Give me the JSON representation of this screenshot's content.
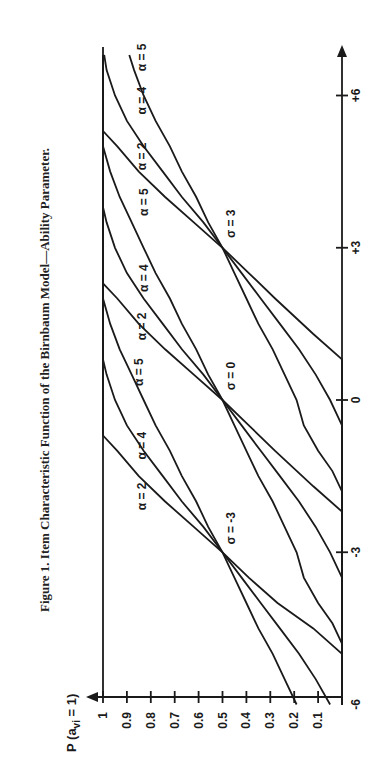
{
  "chart_data": {
    "type": "line",
    "title": "Figure 1. Item Characteristic Function of the Birnbaum Model—Ability Parameter.",
    "xlabel": "",
    "ylabel": "P (a_vi = 1)",
    "ylabel_main": "P (a",
    "ylabel_sub": "vi",
    "ylabel_tail": " = 1)",
    "orientation": "rotated 90° counter-clockwise (ability axis runs upward, probability axis runs horizontally)",
    "x_ticks": [
      {
        "value": -6,
        "label": "-6"
      },
      {
        "value": -3,
        "label": "-3"
      },
      {
        "value": 0,
        "label": "0"
      },
      {
        "value": 3,
        "label": "+3"
      },
      {
        "value": 6,
        "label": "+6"
      }
    ],
    "y_ticks": [
      {
        "value": 1.0,
        "label": "1"
      },
      {
        "value": 0.9,
        "label": "0.9"
      },
      {
        "value": 0.8,
        "label": "0.8"
      },
      {
        "value": 0.7,
        "label": "0.7"
      },
      {
        "value": 0.6,
        "label": "0.6"
      },
      {
        "value": 0.5,
        "label": "0.5"
      },
      {
        "value": 0.4,
        "label": "0.4"
      },
      {
        "value": 0.3,
        "label": "0.3"
      },
      {
        "value": 0.2,
        "label": "0.2"
      },
      {
        "value": 0.1,
        "label": "0.1"
      }
    ],
    "xlim": [
      -6,
      6.8
    ],
    "ylim": [
      0,
      1
    ],
    "grid": false,
    "legend": "none (inline labels)",
    "annotations": [
      {
        "text": "σ = -3",
        "x": -3,
        "y": 0.5
      },
      {
        "text": "σ = 0",
        "x": 0,
        "y": 0.5
      },
      {
        "text": "σ = 3",
        "x": 3,
        "y": 0.5
      }
    ],
    "series": [
      {
        "name": "σ = -3, α = 2",
        "sigma": -3,
        "alpha": 2,
        "points": [
          [
            -6,
            0.0
          ],
          [
            -5.0,
            0.0
          ],
          [
            -4.5,
            0.12
          ],
          [
            -4,
            0.27
          ],
          [
            -3.5,
            0.39
          ],
          [
            -3,
            0.5
          ],
          [
            -2.5,
            0.62
          ],
          [
            -2,
            0.74
          ],
          [
            -1.5,
            0.85
          ],
          [
            -1.0,
            0.94
          ],
          [
            -0.7,
            1.0
          ],
          [
            6.8,
            1.0
          ]
        ]
      },
      {
        "name": "σ = -3, α = 4",
        "sigma": -3,
        "alpha": 4,
        "points": [
          [
            -6,
            0.05
          ],
          [
            -5.5,
            0.11
          ],
          [
            -5,
            0.18
          ],
          [
            -4.5,
            0.26
          ],
          [
            -4,
            0.34
          ],
          [
            -3.5,
            0.42
          ],
          [
            -3,
            0.5
          ],
          [
            -2.5,
            0.58
          ],
          [
            -2,
            0.67
          ],
          [
            -1.5,
            0.75
          ],
          [
            -1,
            0.83
          ],
          [
            -0.5,
            0.9
          ],
          [
            0,
            0.95
          ],
          [
            0.5,
            0.985
          ],
          [
            0.8,
            1.0
          ],
          [
            6.8,
            1.0
          ]
        ]
      },
      {
        "name": "σ = -3, α = 5",
        "sigma": -3,
        "alpha": 5,
        "points": [
          [
            -6,
            0.19
          ],
          [
            -5.5,
            0.24
          ],
          [
            -5,
            0.29
          ],
          [
            -4.5,
            0.35
          ],
          [
            -4,
            0.4
          ],
          [
            -3.5,
            0.45
          ],
          [
            -3,
            0.5
          ],
          [
            -2.5,
            0.56
          ],
          [
            -2,
            0.61
          ],
          [
            -1.5,
            0.67
          ],
          [
            -1,
            0.72
          ],
          [
            -0.5,
            0.78
          ],
          [
            0,
            0.83
          ],
          [
            0.5,
            0.88
          ],
          [
            1,
            0.93
          ],
          [
            1.5,
            0.97
          ],
          [
            2.0,
            1.0
          ],
          [
            6.8,
            1.0
          ]
        ]
      },
      {
        "name": "σ = 0, α = 2",
        "sigma": 0,
        "alpha": 2,
        "points": [
          [
            -6,
            0.0
          ],
          [
            -2.2,
            0.0
          ],
          [
            -1.7,
            0.12
          ],
          [
            -1,
            0.28
          ],
          [
            -0.5,
            0.39
          ],
          [
            0,
            0.5
          ],
          [
            0.5,
            0.62
          ],
          [
            1,
            0.74
          ],
          [
            1.5,
            0.85
          ],
          [
            2,
            0.94
          ],
          [
            2.3,
            1.0
          ],
          [
            6.8,
            1.0
          ]
        ]
      },
      {
        "name": "σ = 0, α = 4",
        "sigma": 0,
        "alpha": 4,
        "points": [
          [
            -6,
            0.0
          ],
          [
            -3.5,
            0.0
          ],
          [
            -3,
            0.05
          ],
          [
            -2.5,
            0.11
          ],
          [
            -2,
            0.18
          ],
          [
            -1.5,
            0.26
          ],
          [
            -1,
            0.34
          ],
          [
            -0.5,
            0.42
          ],
          [
            0,
            0.5
          ],
          [
            0.5,
            0.58
          ],
          [
            1,
            0.67
          ],
          [
            1.5,
            0.75
          ],
          [
            2,
            0.83
          ],
          [
            2.5,
            0.9
          ],
          [
            3,
            0.95
          ],
          [
            3.5,
            0.985
          ],
          [
            3.8,
            1.0
          ],
          [
            6.8,
            1.0
          ]
        ]
      },
      {
        "name": "σ = 0, α = 5",
        "sigma": 0,
        "alpha": 5,
        "points": [
          [
            -6,
            0.0
          ],
          [
            -4.8,
            0.0
          ],
          [
            -4.4,
            0.04
          ],
          [
            -4,
            0.1
          ],
          [
            -3.5,
            0.16
          ],
          [
            -3,
            0.19
          ],
          [
            -2.5,
            0.24
          ],
          [
            -2,
            0.29
          ],
          [
            -1.5,
            0.35
          ],
          [
            -1,
            0.4
          ],
          [
            -0.5,
            0.45
          ],
          [
            0,
            0.5
          ],
          [
            0.5,
            0.56
          ],
          [
            1,
            0.61
          ],
          [
            1.5,
            0.67
          ],
          [
            2,
            0.72
          ],
          [
            2.5,
            0.78
          ],
          [
            3,
            0.83
          ],
          [
            3.5,
            0.88
          ],
          [
            4,
            0.93
          ],
          [
            4.5,
            0.97
          ],
          [
            5.0,
            1.0
          ],
          [
            6.8,
            1.0
          ]
        ]
      },
      {
        "name": "σ = 3, α = 2",
        "sigma": 3,
        "alpha": 2,
        "points": [
          [
            -6,
            0.0
          ],
          [
            0.8,
            0.0
          ],
          [
            1.3,
            0.12
          ],
          [
            2,
            0.28
          ],
          [
            2.5,
            0.39
          ],
          [
            3,
            0.5
          ],
          [
            3.5,
            0.62
          ],
          [
            4,
            0.74
          ],
          [
            4.5,
            0.85
          ],
          [
            5,
            0.94
          ],
          [
            5.3,
            1.0
          ],
          [
            6.8,
            1.0
          ]
        ]
      },
      {
        "name": "σ = 3, α = 4",
        "sigma": 3,
        "alpha": 4,
        "points": [
          [
            -6,
            0.0
          ],
          [
            -0.5,
            0.0
          ],
          [
            0,
            0.05
          ],
          [
            0.5,
            0.11
          ],
          [
            1,
            0.18
          ],
          [
            1.5,
            0.26
          ],
          [
            2,
            0.34
          ],
          [
            2.5,
            0.42
          ],
          [
            3,
            0.5
          ],
          [
            3.5,
            0.58
          ],
          [
            4,
            0.67
          ],
          [
            4.5,
            0.75
          ],
          [
            5,
            0.83
          ],
          [
            5.5,
            0.9
          ],
          [
            6,
            0.95
          ],
          [
            6.5,
            0.985
          ],
          [
            6.8,
            0.995
          ]
        ]
      },
      {
        "name": "σ = 3, α = 5",
        "sigma": 3,
        "alpha": 5,
        "points": [
          [
            -6,
            0.0
          ],
          [
            -1.8,
            0.0
          ],
          [
            -1.4,
            0.04
          ],
          [
            -1,
            0.1
          ],
          [
            -0.5,
            0.16
          ],
          [
            0,
            0.19
          ],
          [
            0.5,
            0.24
          ],
          [
            1,
            0.29
          ],
          [
            1.5,
            0.35
          ],
          [
            2,
            0.4
          ],
          [
            2.5,
            0.45
          ],
          [
            3,
            0.5
          ],
          [
            3.5,
            0.56
          ],
          [
            4,
            0.61
          ],
          [
            4.5,
            0.67
          ],
          [
            5,
            0.72
          ],
          [
            5.5,
            0.78
          ],
          [
            6,
            0.83
          ],
          [
            6.5,
            0.87
          ],
          [
            6.8,
            0.89
          ]
        ]
      }
    ],
    "curve_labels": [
      {
        "text": "α = 2",
        "x": -1.9,
        "y": 0.88
      },
      {
        "text": "α = 4",
        "x": -0.9,
        "y": 0.88
      },
      {
        "text": "α = 5",
        "x": 0.55,
        "y": 0.89
      },
      {
        "text": "α = 2",
        "x": 1.45,
        "y": 0.88
      },
      {
        "text": "α = 4",
        "x": 2.4,
        "y": 0.87
      },
      {
        "text": "α = 5",
        "x": 3.9,
        "y": 0.87
      },
      {
        "text": "α = 2",
        "x": 4.8,
        "y": 0.88
      },
      {
        "text": "α = 4",
        "x": 5.9,
        "y": 0.88
      },
      {
        "text": "α = 5",
        "x": 6.75,
        "y": 0.88
      }
    ]
  }
}
